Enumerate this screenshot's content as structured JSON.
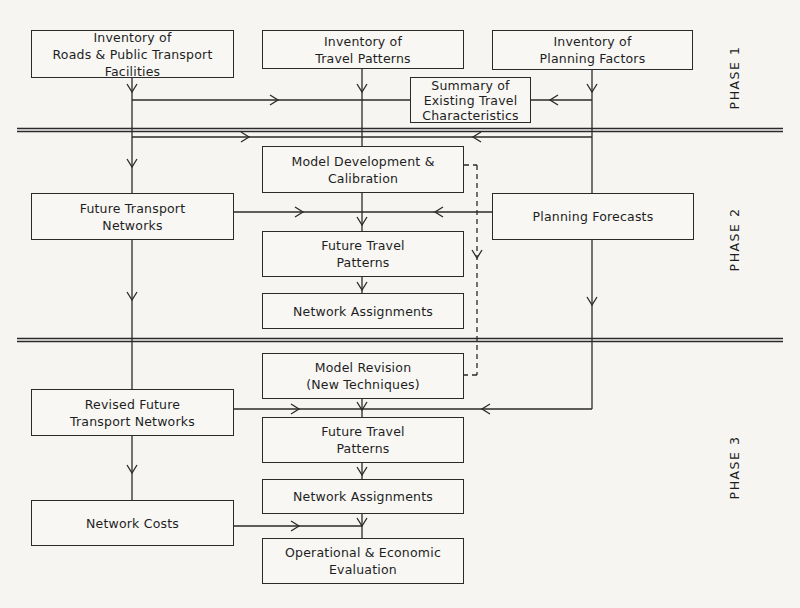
{
  "diagram": {
    "type": "flowchart",
    "phases": [
      {
        "id": "phase1",
        "label": "PHASE 1"
      },
      {
        "id": "phase2",
        "label": "PHASE 2"
      },
      {
        "id": "phase3",
        "label": "PHASE 3"
      }
    ],
    "nodes": {
      "inv_roads": "Inventory of\nRoads & Public Transport\nFacilities",
      "inv_travel": "Inventory of\nTravel Patterns",
      "inv_planning": "Inventory of\nPlanning Factors",
      "summary": "Summary of\nExisting Travel\nCharacteristics",
      "model_dev": "Model Development &\nCalibration",
      "future_networks": "Future Transport\nNetworks",
      "planning_forecasts": "Planning Forecasts",
      "future_travel_2": "Future Travel\nPatterns",
      "net_assign_2": "Network Assignments",
      "model_revision": "Model Revision\n(New Techniques)",
      "revised_networks": "Revised Future\nTransport Networks",
      "future_travel_3": "Future Travel\nPatterns",
      "net_assign_3": "Network Assignments",
      "network_costs": "Network Costs",
      "evaluation": "Operational & Economic\nEvaluation"
    },
    "edges": [
      {
        "from": "inv_roads",
        "to": "summary"
      },
      {
        "from": "inv_travel",
        "to": "summary"
      },
      {
        "from": "inv_planning",
        "to": "summary"
      },
      {
        "from": "inv_roads",
        "to": "model_dev"
      },
      {
        "from": "inv_travel",
        "to": "model_dev"
      },
      {
        "from": "inv_planning",
        "to": "model_dev"
      },
      {
        "from": "inv_roads",
        "to": "future_networks"
      },
      {
        "from": "inv_planning",
        "to": "planning_forecasts"
      },
      {
        "from": "model_dev",
        "to": "future_travel_2"
      },
      {
        "from": "future_networks",
        "to": "future_travel_2"
      },
      {
        "from": "planning_forecasts",
        "to": "future_travel_2"
      },
      {
        "from": "future_travel_2",
        "to": "net_assign_2"
      },
      {
        "from": "model_dev",
        "to": "model_revision",
        "style": "dashed"
      },
      {
        "from": "future_networks",
        "to": "revised_networks"
      },
      {
        "from": "model_revision",
        "to": "future_travel_3"
      },
      {
        "from": "revised_networks",
        "to": "future_travel_3"
      },
      {
        "from": "planning_forecasts",
        "to": "future_travel_3"
      },
      {
        "from": "future_travel_3",
        "to": "net_assign_3"
      },
      {
        "from": "revised_networks",
        "to": "network_costs"
      },
      {
        "from": "net_assign_3",
        "to": "evaluation"
      },
      {
        "from": "network_costs",
        "to": "evaluation"
      }
    ]
  }
}
